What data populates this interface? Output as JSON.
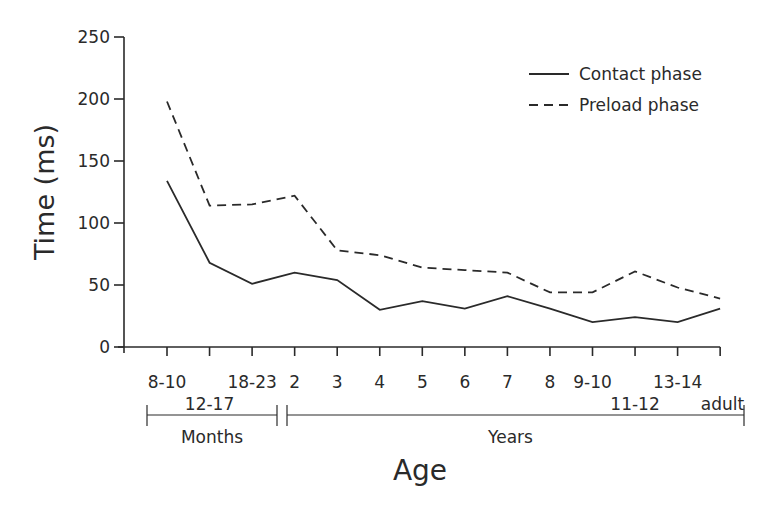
{
  "chart_data": {
    "type": "line",
    "title": "",
    "xlabel": "Age",
    "ylabel": "Time (ms)",
    "ylim": [
      0,
      250
    ],
    "yticks": [
      0,
      50,
      100,
      150,
      200,
      250
    ],
    "grid": false,
    "legend_position": "upper right",
    "categories": [
      "8-10",
      "12-17",
      "18-23",
      "2",
      "3",
      "4",
      "5",
      "6",
      "7",
      "8",
      "9-10",
      "11-12",
      "13-14",
      "adult"
    ],
    "category_rows": [
      0,
      1,
      0,
      0,
      0,
      0,
      0,
      0,
      0,
      0,
      0,
      1,
      0,
      1
    ],
    "groups": [
      {
        "label": "Months",
        "from": "8-10",
        "to": "18-23"
      },
      {
        "label": "Years",
        "from": "2",
        "to": "adult"
      }
    ],
    "series": [
      {
        "name": "Contact phase",
        "style": "solid",
        "values": [
          134,
          68,
          51,
          60,
          54,
          30,
          37,
          31,
          41,
          31,
          20,
          24,
          20,
          31
        ]
      },
      {
        "name": "Preload phase",
        "style": "dashed",
        "values": [
          198,
          114,
          115,
          122,
          78,
          74,
          64,
          62,
          60,
          44,
          44,
          61,
          48,
          39
        ]
      }
    ]
  },
  "colors": {
    "line": "#2a2a2a",
    "background": "#ffffff"
  }
}
